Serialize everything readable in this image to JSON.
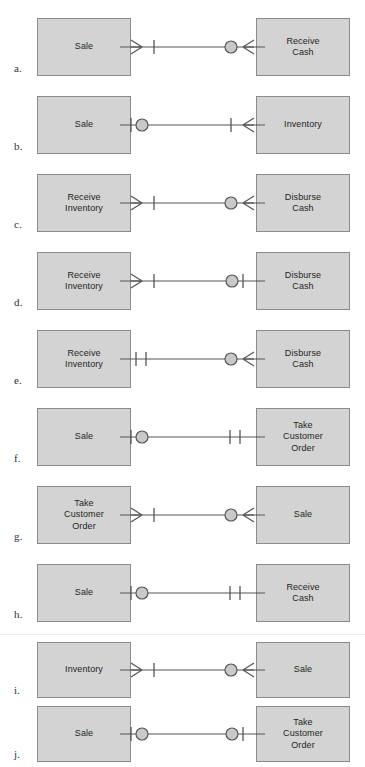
{
  "figure": {
    "colors": {
      "entity_fill": "#d3d3d3",
      "entity_border": "#8b8b8b",
      "line": "#55555c",
      "text": "#1f1f22",
      "page_background": "#ffffff",
      "seam_line": "#ebebeb"
    },
    "notation": {
      "crow_foot": "many",
      "bar": "one",
      "circle": "zero-optional",
      "double_bar": "exactly-one",
      "bar_circle": "zero-or-one",
      "crow_bar": "one-or-many",
      "circle_crow": "zero-or-many"
    }
  },
  "rows": [
    {
      "label": "a.",
      "left_entity": "Sale",
      "right_entity": "Receive\nCash",
      "left_cardinality": "crow-bar",
      "right_cardinality": "circle-crow",
      "left_symbols": [
        "crow-foot",
        "bar"
      ],
      "right_symbols": [
        "circle",
        "crow-foot"
      ]
    },
    {
      "label": "b.",
      "left_entity": "Sale",
      "right_entity": "Inventory",
      "left_cardinality": "bar-circle",
      "right_cardinality": "bar-crow",
      "left_symbols": [
        "bar",
        "circle"
      ],
      "right_symbols": [
        "bar",
        "crow-foot"
      ]
    },
    {
      "label": "c.",
      "left_entity": "Receive\nInventory",
      "right_entity": "Disburse\nCash",
      "left_cardinality": "crow-bar",
      "right_cardinality": "circle-crow",
      "left_symbols": [
        "crow-foot",
        "bar"
      ],
      "right_symbols": [
        "circle",
        "crow-foot"
      ]
    },
    {
      "label": "d.",
      "left_entity": "Receive\nInventory",
      "right_entity": "Disburse\nCash",
      "left_cardinality": "crow-bar",
      "right_cardinality": "circle-bar",
      "left_symbols": [
        "crow-foot",
        "bar"
      ],
      "right_symbols": [
        "circle",
        "bar"
      ]
    },
    {
      "label": "e.",
      "left_entity": "Receive\nInventory",
      "right_entity": "Disburse\nCash",
      "left_cardinality": "double-bar",
      "right_cardinality": "circle-crow",
      "left_symbols": [
        "bar",
        "bar"
      ],
      "right_symbols": [
        "circle",
        "crow-foot"
      ]
    },
    {
      "label": "f.",
      "left_entity": "Sale",
      "right_entity": "Take\nCustomer\nOrder",
      "left_cardinality": "bar-circle",
      "right_cardinality": "double-bar",
      "left_symbols": [
        "bar",
        "circle"
      ],
      "right_symbols": [
        "bar",
        "bar"
      ]
    },
    {
      "label": "g.",
      "left_entity": "Take\nCustomer\nOrder",
      "right_entity": "Sale",
      "left_cardinality": "crow-bar",
      "right_cardinality": "circle-crow",
      "left_symbols": [
        "crow-foot",
        "bar"
      ],
      "right_symbols": [
        "circle",
        "crow-foot"
      ]
    },
    {
      "label": "h.",
      "left_entity": "Sale",
      "right_entity": "Receive\nCash",
      "left_cardinality": "bar-circle",
      "right_cardinality": "double-bar",
      "left_symbols": [
        "bar",
        "circle"
      ],
      "right_symbols": [
        "bar",
        "bar"
      ]
    },
    {
      "label": "i.",
      "left_entity": "Inventory",
      "right_entity": "Sale",
      "left_cardinality": "crow-bar",
      "right_cardinality": "circle-crow",
      "left_symbols": [
        "crow-foot",
        "bar"
      ],
      "right_symbols": [
        "circle",
        "crow-foot"
      ]
    },
    {
      "label": "j.",
      "left_entity": "Sale",
      "right_entity": "Take\nCustomer\nOrder",
      "left_cardinality": "bar-circle",
      "right_cardinality": "circle-bar",
      "left_symbols": [
        "bar",
        "circle"
      ],
      "right_symbols": [
        "circle",
        "bar"
      ]
    }
  ],
  "layout": {
    "row_tops": [
      18,
      96,
      174,
      252,
      330,
      408,
      486,
      564,
      642,
      706
    ],
    "row_heights": [
      58,
      58,
      58,
      58,
      58,
      58,
      58,
      58,
      56,
      56
    ],
    "seam_top": 634
  }
}
